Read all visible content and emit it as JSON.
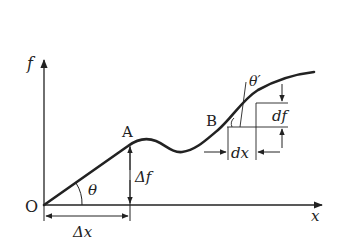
{
  "diagram": {
    "type": "function-graph-derivative-illustration",
    "axes": {
      "y_label": "f",
      "x_label": "x",
      "origin_label": "O"
    },
    "points": {
      "A": "A",
      "B": "B"
    },
    "annotations": {
      "theta": "θ",
      "theta_prime": "θ′",
      "delta_x": "Δx",
      "delta_f": "Δf",
      "dx": "dx",
      "df": "df"
    },
    "colors": {
      "stroke": "#222222",
      "background": "#ffffff"
    }
  }
}
